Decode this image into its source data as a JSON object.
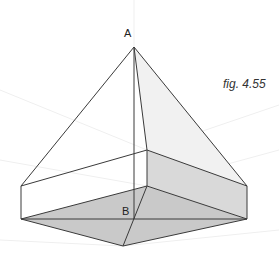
{
  "figure": {
    "caption": "fig. 4.55",
    "labels": {
      "apex": "A",
      "base_point": "B"
    },
    "colors": {
      "line": "#3a3a3a",
      "guide": "#ececec",
      "base_fill": "#c8c8c8",
      "box_right_fill": "#d6d6d6",
      "face_right_fill": "#f0f0f0",
      "box_front_fill": "#ffffff"
    },
    "points": {
      "A": [
        134,
        47
      ],
      "B": [
        134,
        219
      ],
      "box_top_left": [
        21,
        186
      ],
      "box_top_back": [
        147,
        150
      ],
      "box_top_right": [
        247,
        186
      ],
      "base_left": [
        21,
        219
      ],
      "base_back": [
        147,
        186
      ],
      "base_right": [
        247,
        219
      ],
      "base_front": [
        123,
        246
      ]
    }
  }
}
